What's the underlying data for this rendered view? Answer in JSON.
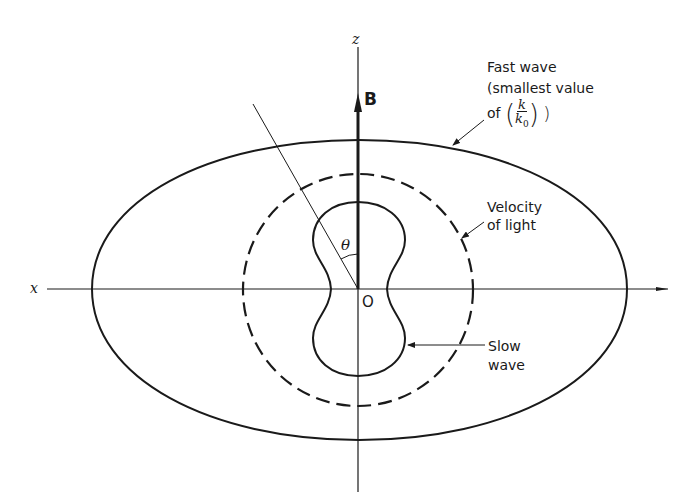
{
  "diagram": {
    "axes": {
      "x_label": "x",
      "z_label": "z",
      "origin_label": "O",
      "field_label": "B",
      "angle_label": "θ"
    },
    "curves": [
      {
        "id": "fast-wave",
        "style": "solid",
        "shape": "oval"
      },
      {
        "id": "velocity-of-light",
        "style": "dashed",
        "shape": "circle"
      },
      {
        "id": "slow-wave",
        "style": "solid",
        "shape": "peanut"
      }
    ],
    "annotations": {
      "fast_wave_line1": "Fast wave",
      "fast_wave_line2": "(smallest value",
      "fast_wave_line3_prefix": "of",
      "fast_wave_frac_num": "k",
      "fast_wave_frac_den": "k",
      "fast_wave_frac_den_sub": "0",
      "velocity_line1": "Velocity",
      "velocity_line2": "of light",
      "slow_line1": "Slow",
      "slow_line2": "wave"
    },
    "colors": {
      "ink": "#1a1a1a",
      "background": "#ffffff"
    }
  }
}
